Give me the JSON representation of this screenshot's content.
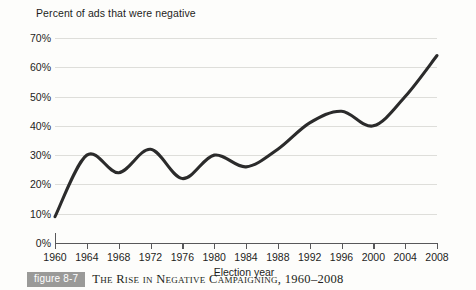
{
  "figure": {
    "badge_label": "figure 8-7",
    "caption": "The Rise in Negative Campaigning, 1960–2008"
  },
  "chart_data": {
    "type": "line",
    "title": "Percent of ads that were negative",
    "xlabel": "Election year",
    "ylabel": "",
    "xlim": [
      1960,
      2008
    ],
    "ylim": [
      0,
      70
    ],
    "grid": true,
    "legend": false,
    "smoothed": true,
    "line_color": "#2b2b2b",
    "gridline_color": "#dededa",
    "axis_color": "#58585a",
    "background_color": "#fdfdfb",
    "ytick_labels": [
      "0%",
      "10%",
      "20%",
      "30%",
      "40%",
      "50%",
      "60%",
      "70%"
    ],
    "ytick_values": [
      0,
      10,
      20,
      30,
      40,
      50,
      60,
      70
    ],
    "xtick_labels": [
      "1960",
      "1964",
      "1968",
      "1972",
      "1976",
      "1980",
      "1984",
      "1988",
      "1992",
      "1996",
      "2000",
      "2004",
      "2008"
    ],
    "x": [
      1960,
      1964,
      1968,
      1972,
      1976,
      1980,
      1984,
      1988,
      1992,
      1996,
      2000,
      2004,
      2008
    ],
    "values": [
      9,
      30,
      24,
      32,
      22,
      30,
      26,
      32,
      41,
      45,
      40,
      50,
      64
    ],
    "series": [
      {
        "name": "Percent of ads that were negative",
        "values": [
          9,
          30,
          24,
          32,
          22,
          30,
          26,
          32,
          41,
          45,
          40,
          50,
          64
        ]
      }
    ]
  }
}
